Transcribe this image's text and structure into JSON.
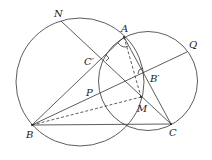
{
  "diagram": {
    "stroke_color": "#333333",
    "labels": {
      "N": "N",
      "A": "A",
      "Q": "Q",
      "C_prime": "C′",
      "B_prime": "B′",
      "P": "P",
      "M": "M",
      "B": "B",
      "C": "C"
    },
    "points": {
      "A": [
        124,
        37
      ],
      "B": [
        32,
        125
      ],
      "C": [
        171,
        124
      ],
      "N": [
        61,
        21
      ],
      "Q": [
        187,
        52
      ],
      "C_prime": [
        103,
        58
      ],
      "B_prime": [
        142,
        72
      ],
      "M": [
        141,
        97
      ],
      "P": [
        97,
        88
      ]
    },
    "circles": [
      {
        "name": "circle-ABN",
        "cx": 80,
        "cy": 82,
        "r": 64
      },
      {
        "name": "circle-ACQ",
        "cx": 148,
        "cy": 81,
        "r": 49.5
      }
    ]
  }
}
